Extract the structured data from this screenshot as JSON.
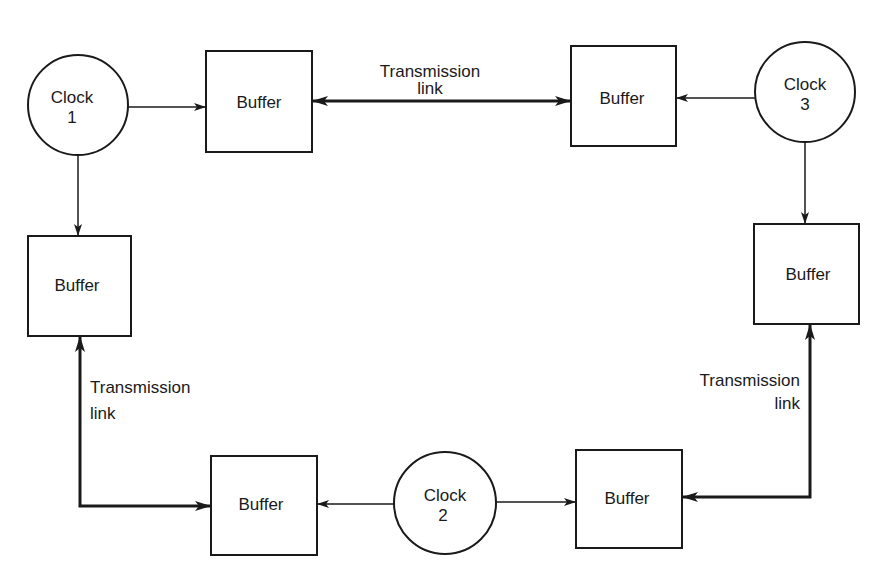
{
  "diagram": {
    "type": "clock-buffer network",
    "colors": {
      "stroke": "#1a1a1a",
      "background": "#ffffff"
    },
    "clocks": [
      {
        "id": "clock1",
        "line1": "Clock",
        "line2": "1"
      },
      {
        "id": "clock2",
        "line1": "Clock",
        "line2": "2"
      },
      {
        "id": "clock3",
        "line1": "Clock",
        "line2": "3"
      }
    ],
    "buffers": [
      {
        "id": "buffer-top-left",
        "label": "Buffer"
      },
      {
        "id": "buffer-top-right",
        "label": "Buffer"
      },
      {
        "id": "buffer-left",
        "label": "Buffer"
      },
      {
        "id": "buffer-right",
        "label": "Buffer"
      },
      {
        "id": "buffer-bottom-left",
        "label": "Buffer"
      },
      {
        "id": "buffer-bottom-right",
        "label": "Buffer"
      }
    ],
    "links": [
      {
        "id": "link-top",
        "line1": "Transmission",
        "line2": "link"
      },
      {
        "id": "link-left",
        "line1": "Transmission",
        "line2": "link"
      },
      {
        "id": "link-right",
        "line1": "Transmission",
        "line2": "link"
      }
    ]
  }
}
